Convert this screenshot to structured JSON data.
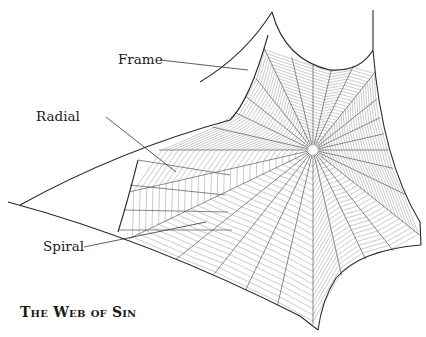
{
  "diagram": {
    "title": "The Web of Sin",
    "labels": [
      {
        "text": "Frame",
        "x": 118,
        "y": 53,
        "pointer_to": [
          248,
          70
        ]
      },
      {
        "text": "Radial",
        "x": 36,
        "y": 110,
        "pointer_to": [
          176,
          172
        ]
      },
      {
        "text": "Spiral",
        "x": 43,
        "y": 240,
        "pointer_to": [
          206,
          222
        ]
      }
    ],
    "colors": {
      "frame": "#2a2a2a",
      "radial": "#555555",
      "spiral": "#9a9a9a",
      "text": "#1a1a1a",
      "background": "#ffffff"
    }
  }
}
